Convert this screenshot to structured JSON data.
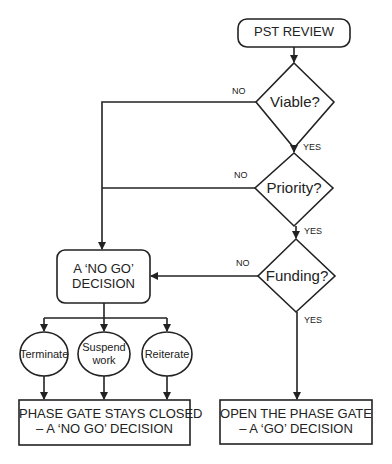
{
  "diagram": {
    "type": "flowchart",
    "start": {
      "label": "PST REVIEW"
    },
    "decisions": [
      {
        "label": "Viable?",
        "no": "NO",
        "yes": "YES"
      },
      {
        "label": "Priority?",
        "no": "NO",
        "yes": "YES"
      },
      {
        "label": "Funding?",
        "no": "NO",
        "yes": "YES"
      }
    ],
    "no_go": {
      "line1": "A ‘NO GO’",
      "line2": "DECISION"
    },
    "options": [
      {
        "label_line1": "Terminate",
        "label_line2": ""
      },
      {
        "label_line1": "Suspend",
        "label_line2": "work"
      },
      {
        "label_line1": "Reiterate",
        "label_line2": ""
      }
    ],
    "closed_outcome": {
      "line1": "PHASE GATE STAYS CLOSED",
      "line2": "– A ‘NO GO’ DECISION"
    },
    "open_outcome": {
      "line1": "OPEN THE PHASE GATE",
      "line2": "– A ‘GO’ DECISION"
    },
    "colors": {
      "stroke": "#222222",
      "background": "#ffffff"
    }
  }
}
